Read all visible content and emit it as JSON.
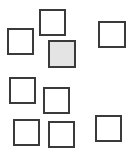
{
  "canvas": {
    "width": 133,
    "height": 156,
    "background": "#ffffff"
  },
  "style": {
    "stroke": "#3a3a3a",
    "stroke_width": 2,
    "highlight_fill": "#e4e4e4"
  },
  "boxes": [
    {
      "id": "box-1",
      "x": 7,
      "y": 28,
      "w": 27,
      "h": 27,
      "highlighted": false
    },
    {
      "id": "box-2",
      "x": 39,
      "y": 9,
      "w": 27,
      "h": 27,
      "highlighted": false
    },
    {
      "id": "box-3",
      "x": 48,
      "y": 40,
      "w": 28,
      "h": 28,
      "highlighted": true
    },
    {
      "id": "box-4",
      "x": 98,
      "y": 21,
      "w": 28,
      "h": 27,
      "highlighted": false
    },
    {
      "id": "box-5",
      "x": 9,
      "y": 77,
      "w": 27,
      "h": 27,
      "highlighted": false
    },
    {
      "id": "box-6",
      "x": 43,
      "y": 87,
      "w": 27,
      "h": 27,
      "highlighted": false
    },
    {
      "id": "box-7",
      "x": 13,
      "y": 119,
      "w": 27,
      "h": 27,
      "highlighted": false
    },
    {
      "id": "box-8",
      "x": 48,
      "y": 121,
      "w": 27,
      "h": 27,
      "highlighted": false
    },
    {
      "id": "box-9",
      "x": 95,
      "y": 115,
      "w": 27,
      "h": 27,
      "highlighted": false
    }
  ]
}
